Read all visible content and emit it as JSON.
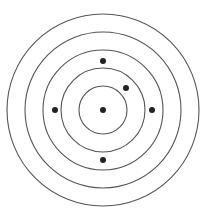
{
  "diagram": {
    "type": "concentric-target",
    "center": [
      103,
      110
    ],
    "ring_color": "#555555",
    "dot_color": "#222222",
    "rings": [
      {
        "r": 96
      },
      {
        "r": 78
      },
      {
        "r": 60
      },
      {
        "r": 42
      },
      {
        "r": 24
      }
    ],
    "dots": [
      {
        "x": 103,
        "y": 110,
        "label": "center"
      },
      {
        "x": 103,
        "y": 61,
        "label": "top"
      },
      {
        "x": 126,
        "y": 88,
        "label": "upper-right"
      },
      {
        "x": 55,
        "y": 110,
        "label": "left"
      },
      {
        "x": 152,
        "y": 110,
        "label": "right"
      },
      {
        "x": 103,
        "y": 160,
        "label": "bottom"
      }
    ]
  }
}
